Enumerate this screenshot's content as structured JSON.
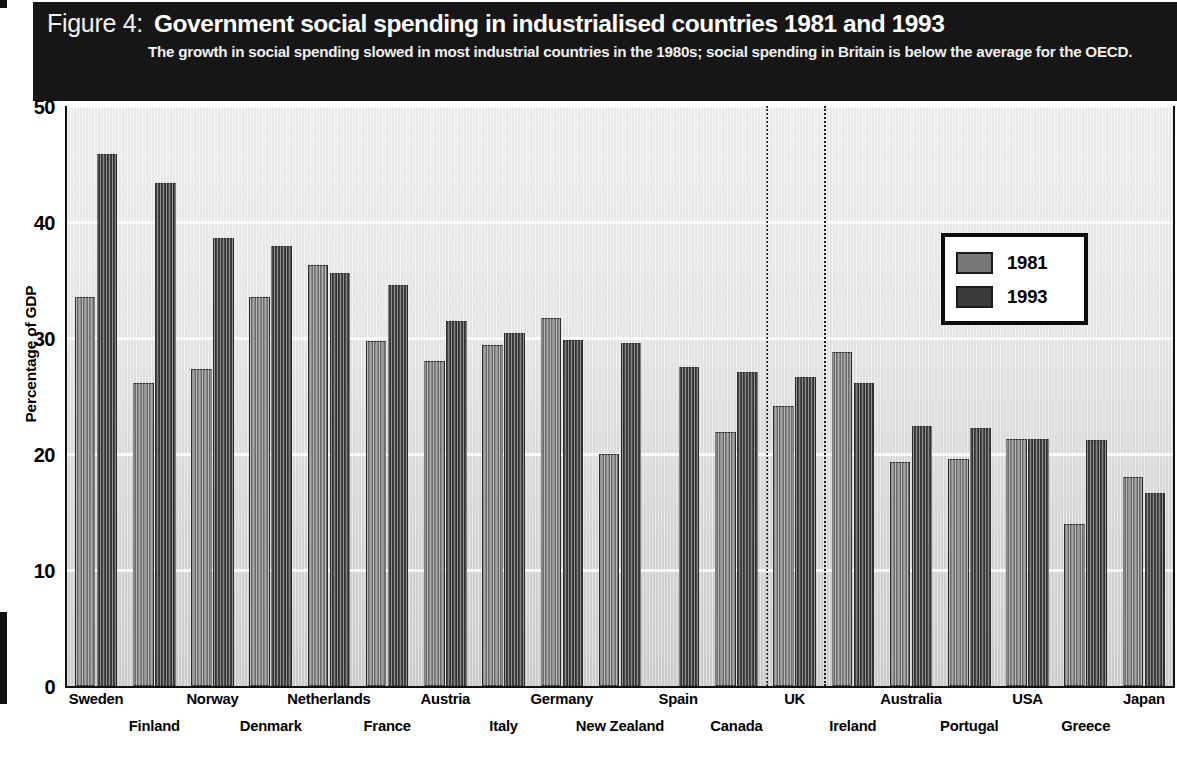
{
  "header": {
    "figure_number": "Figure 4:",
    "title": "Government social spending in industrialised countries 1981 and 1993",
    "subtitle": "The growth in social spending slowed in most industrial countries in the 1980s; social spending in Britain is below the average for the OECD."
  },
  "legend": {
    "position": "inside-top-right",
    "entries": [
      {
        "label": "1981",
        "color": "#787878"
      },
      {
        "label": "1993",
        "color": "#3a3a3a"
      }
    ]
  },
  "axis": {
    "y_title": "Percentage of GDP",
    "y_ticks": [
      "0",
      "10",
      "20",
      "30",
      "40",
      "50"
    ]
  },
  "annotations": {
    "divider_label_left": "UK",
    "divider_note": "dotted vertical lines bracketing the UK column group"
  },
  "chart_data": {
    "type": "bar",
    "title": "Government social spending in industrialised countries 1981 and 1993",
    "subtitle": "The growth in social spending slowed in most industrial countries in the 1980s; social spending in Britain is below the average for the OECD.",
    "xlabel": "",
    "ylabel": "Percentage of GDP",
    "ylim": [
      0,
      50
    ],
    "yticks": [
      0,
      10,
      20,
      30,
      40,
      50
    ],
    "grid": true,
    "legend_position": "top right",
    "categories": [
      "Sweden",
      "Finland",
      "Norway",
      "Denmark",
      "Netherlands",
      "France",
      "Austria",
      "Italy",
      "Germany",
      "New Zealand",
      "Spain",
      "Canada",
      "UK",
      "Ireland",
      "Australia",
      "Portugal",
      "USA",
      "Greece",
      "Japan"
    ],
    "series": [
      {
        "name": "1981",
        "color": "#787878",
        "values": [
          33.5,
          26.1,
          27.3,
          33.5,
          36.3,
          29.7,
          28.0,
          29.4,
          31.7,
          20.0,
          null,
          21.9,
          24.1,
          28.8,
          19.3,
          19.6,
          21.3,
          14.0,
          18.0
        ]
      },
      {
        "name": "1993",
        "color": "#3a3a3a",
        "values": [
          45.9,
          43.4,
          38.6,
          37.9,
          35.6,
          34.6,
          31.5,
          30.4,
          29.8,
          29.6,
          27.5,
          27.1,
          26.6,
          26.1,
          22.4,
          22.2,
          21.3,
          21.2,
          16.6
        ]
      }
    ]
  }
}
